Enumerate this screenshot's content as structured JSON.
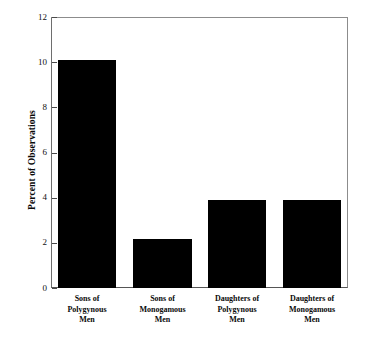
{
  "chart_data": {
    "type": "bar",
    "title": "",
    "subtitle": "",
    "xlabel": "",
    "ylabel": "Percent of Observations",
    "ylim": [
      0,
      12
    ],
    "yticks": [
      0,
      2,
      4,
      6,
      8,
      10,
      12
    ],
    "ytick_labels": [
      "0",
      "2",
      "4",
      "6",
      "8",
      "10",
      "12"
    ],
    "grid": false,
    "legend": false,
    "bar_color": "#000000",
    "frame_color": "#8c8c8c",
    "background": "#ffffff",
    "categories": [
      "Sons of Polygynous Men",
      "Sons of Monogamous Men",
      "Daughters of Polygynous Men",
      "Daughters of Monogamous Men"
    ],
    "category_lines": [
      [
        "Sons of",
        "Polygynous",
        "Men"
      ],
      [
        "Sons of",
        "Monogamous",
        "Men"
      ],
      [
        "Daughters of",
        "Polygynous",
        "Men"
      ],
      [
        "Daughters of",
        "Monogamous",
        "Men"
      ]
    ],
    "values": [
      10.1,
      2.15,
      3.9,
      3.9
    ]
  }
}
